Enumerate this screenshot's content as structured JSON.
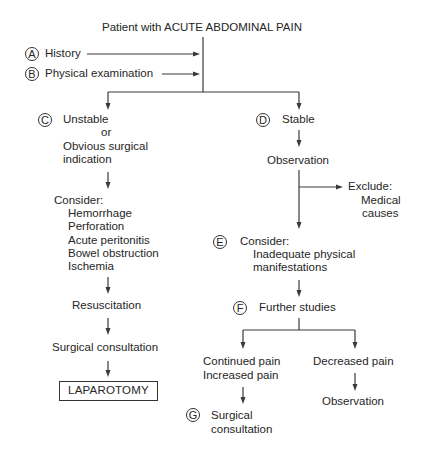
{
  "diagram": {
    "title": "Patient with ACUTE ABDOMINAL PAIN",
    "inputs": [
      {
        "marker": "A",
        "label": "History"
      },
      {
        "marker": "B",
        "label": "Physical examination"
      }
    ],
    "left_branch": {
      "marker": "C",
      "condition_lines": [
        "Unstable",
        "or",
        "Obvious surgical",
        "indication"
      ],
      "consider": {
        "heading": "Consider:",
        "items": [
          "Hemorrhage",
          "Perforation",
          "Acute peritonitis",
          "Bowel obstruction",
          "Ischemia"
        ]
      },
      "step_resuscitation": "Resuscitation",
      "step_consultation": "Surgical consultation",
      "outcome": "LAPAROTOMY"
    },
    "right_branch": {
      "marker": "D",
      "condition": "Stable",
      "step_observation": "Observation",
      "exclude": {
        "heading": "Exclude:",
        "lines": [
          "Medical",
          "causes"
        ]
      },
      "consider": {
        "marker": "E",
        "heading": "Consider:",
        "lines": [
          "Inadequate physical",
          "manifestations"
        ]
      },
      "further": {
        "marker": "F",
        "label": "Further studies"
      },
      "outcomes": {
        "worse": {
          "lines": [
            "Continued pain",
            "Increased pain"
          ],
          "next_marker": "G",
          "next_lines": [
            "Surgical",
            "consultation"
          ]
        },
        "better": {
          "label": "Decreased pain",
          "next": "Observation"
        }
      }
    }
  }
}
